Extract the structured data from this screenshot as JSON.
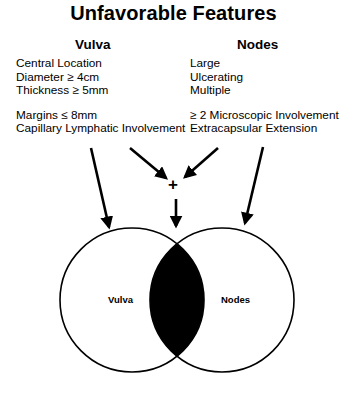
{
  "title": "Unfavorable Features",
  "columns": {
    "vulva": {
      "heading": "Vulva",
      "group1": [
        "Central Location",
        "Diameter ≥ 4cm",
        "Thickness ≥ 5mm"
      ],
      "group2": [
        "Margins ≤ 8mm",
        "Capillary Lymphatic Involvement"
      ]
    },
    "nodes": {
      "heading": "Nodes",
      "group1": [
        "Large",
        "Ulcerating",
        "Multiple"
      ],
      "group2": [
        "≥ 2 Microscopic Involvement",
        "Extracapsular Extension"
      ]
    }
  },
  "combine_symbol": "+",
  "venn": {
    "left_label": "Vulva",
    "right_label": "Nodes",
    "intersection_fill": "#000000",
    "stroke_color": "#000000"
  }
}
